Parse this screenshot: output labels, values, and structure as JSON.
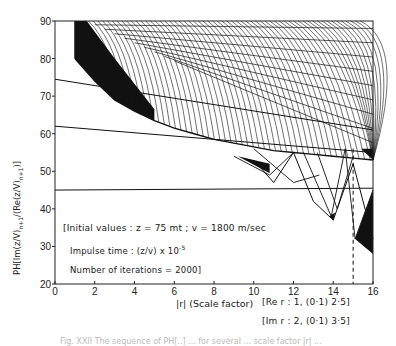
{
  "chart_data": {
    "type": "line",
    "title": "",
    "xlabel": "|r| (Scale factor)",
    "ylabel": "PH[Im(z/V)n+1/(Re(z/V)n+1)]",
    "xlim": [
      0,
      16
    ],
    "ylim": [
      20,
      90
    ],
    "x_ticks": [
      0,
      2,
      4,
      6,
      8,
      10,
      12,
      14,
      16
    ],
    "y_ticks": [
      20,
      30,
      40,
      50,
      60,
      70,
      80,
      90
    ],
    "grid": false,
    "legend": null,
    "annotations": [
      "[Initial values : z = 75 mt ; v = 1800 m/sec",
      "Impulse time : (z/v) x 10^-5",
      "Number of iterations = 2000]",
      "[Re r : 1, (0·1) 2·5]",
      "[Im r : 2, (0·1) 3·5]"
    ],
    "reference_lines": [
      {
        "type": "vertical-dashed",
        "x": 15
      }
    ],
    "series": [
      {
        "name": "envelope-lower",
        "x": [
          1,
          2,
          3,
          4,
          5,
          6,
          7,
          8,
          9,
          10,
          11,
          12,
          13,
          14,
          15,
          16
        ],
        "values": [
          80,
          74,
          69,
          66,
          63.5,
          61.5,
          60,
          58.5,
          57.5,
          56.5,
          55.5,
          55,
          54.5,
          54,
          53.5,
          53
        ]
      },
      {
        "name": "straight-line-1",
        "x": [
          0,
          16
        ],
        "values": [
          74.5,
          61
        ]
      },
      {
        "name": "straight-line-2",
        "x": [
          0,
          16
        ],
        "values": [
          62,
          55
        ]
      },
      {
        "name": "straight-line-3",
        "x": [
          0,
          16
        ],
        "values": [
          45,
          45.5
        ]
      },
      {
        "name": "dip-series",
        "x": [
          10,
          11,
          12,
          13,
          14,
          15,
          16
        ],
        "values": [
          53,
          47,
          55,
          42,
          37,
          52,
          32
        ]
      }
    ]
  },
  "labels": {
    "ylabel_text": "PH[Im(z/V)",
    "ylabel_sub1": "n+1",
    "ylabel_mid": "/(Re(z/V)",
    "ylabel_sub2": "n+1",
    "ylabel_end": ")]",
    "xlabel": "|r| (Scale factor)",
    "ann_line1": "[Initial values : z = 75 mt ;  v = 1800 m/sec",
    "ann_line2_pre": "Impulse time : (z/v) x 10",
    "ann_line2_sup": "-5",
    "ann_line3": "Number of iterations = 2000]",
    "re_r": "[Re  r : 1, (0·1) 2·5]",
    "im_r": "[Im  r : 2, (0·1) 3·5]",
    "caption": "Fig. XXII  The sequence of PH[..] ... for several ... scale factor |r| ..."
  }
}
